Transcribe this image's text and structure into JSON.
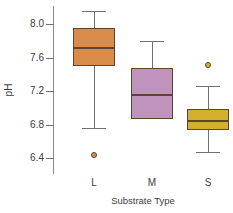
{
  "chart_data": {
    "type": "box",
    "title": "",
    "xlabel": "Substrate Type",
    "ylabel": "pH",
    "categories": [
      "L",
      "M",
      "S"
    ],
    "ylim": [
      6.25,
      8.25
    ],
    "yticks": [
      6.4,
      6.8,
      7.2,
      7.6,
      8.0
    ],
    "ytick_labels": [
      "6.4",
      "6.8",
      "7.2",
      "7.6",
      "8.0"
    ],
    "grid": false,
    "legend": "none",
    "boxes": [
      {
        "category": "L",
        "color": "#D98C4A",
        "whisker_high": 8.16,
        "q3": 7.95,
        "median": 7.71,
        "q1": 7.5,
        "whisker_low": 6.76,
        "outliers": [
          6.44
        ]
      },
      {
        "category": "M",
        "color": "#C093BC",
        "whisker_high": 7.8,
        "q3": 7.48,
        "median": 7.15,
        "q1": 6.86,
        "whisker_low": 6.86,
        "outliers": []
      },
      {
        "category": "S",
        "color": "#D4B02E",
        "whisker_high": 7.26,
        "q3": 6.99,
        "median": 6.84,
        "q1": 6.73,
        "whisker_low": 6.47,
        "outliers": [
          7.51
        ]
      }
    ]
  }
}
